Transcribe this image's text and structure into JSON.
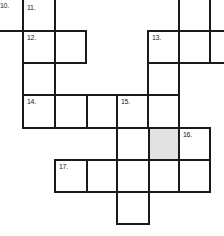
{
  "puzzle": {
    "type": "crossword",
    "clue_numbers": {
      "c10": "10.",
      "c11": "11.",
      "c12": "12.",
      "c13": "13.",
      "c14": "14.",
      "c15": "15.",
      "c16": "16.",
      "c17": "17."
    },
    "shaded_color": "#e2e2e2",
    "grid_color": "#1a1a1a"
  }
}
